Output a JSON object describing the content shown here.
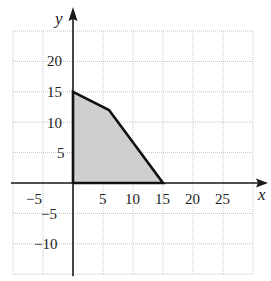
{
  "chart_data": {
    "type": "area",
    "title": "",
    "xlabel": "x",
    "ylabel": "y",
    "xlim": [
      -10,
      30
    ],
    "ylim": [
      -15,
      25
    ],
    "grid": true,
    "grid_step": 5,
    "x_ticks": [
      -5,
      5,
      10,
      15,
      20,
      25
    ],
    "x_tick_labels": [
      "−5",
      "5",
      "10",
      "15",
      "20",
      "25"
    ],
    "y_ticks": [
      -10,
      -5,
      5,
      10,
      15,
      20
    ],
    "y_tick_labels": [
      "−10",
      "−5",
      "5",
      "10",
      "15",
      "20"
    ],
    "region": {
      "name": "feasible region",
      "vertices": [
        [
          0,
          0
        ],
        [
          0,
          15
        ],
        [
          6,
          12
        ],
        [
          15,
          0
        ]
      ],
      "fill_color": "#cfcfcf",
      "edge_color": "#111111"
    },
    "legend": null
  },
  "labels": {
    "x_axis": "x",
    "y_axis": "y",
    "x_ticks": {
      "m5": "−5",
      "p5": "5",
      "p10": "10",
      "p15": "15",
      "p20": "20",
      "p25": "25"
    },
    "y_ticks": {
      "m10": "−10",
      "m5": "−5",
      "p5": "5",
      "p10": "10",
      "p15": "15",
      "p20": "20"
    }
  }
}
